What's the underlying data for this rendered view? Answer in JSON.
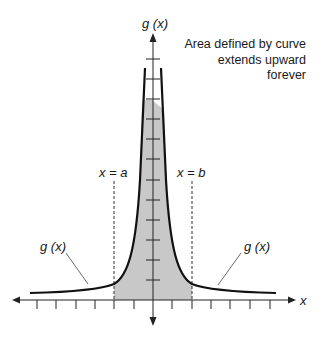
{
  "diagram": {
    "y_axis_label": "g (x)",
    "x_axis_label": "x",
    "annotation": [
      "Area defined by curve",
      "extends upward",
      "forever"
    ],
    "boundary_left_label": "x = a",
    "boundary_right_label": "x = b",
    "curve_label_left": "g (x)",
    "curve_label_right": "g (x)",
    "colors": {
      "curve": "#111111",
      "shade": "#c8c8c8",
      "axis": "#222222",
      "dashed": "#333333"
    },
    "x_ticks_left": 6,
    "x_ticks_right": 6,
    "y_ticks": 12
  }
}
